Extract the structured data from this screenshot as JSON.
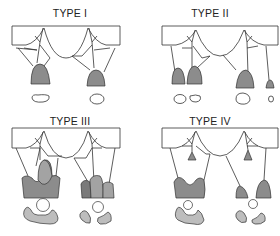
{
  "figure": {
    "panels": [
      {
        "id": "type-1",
        "title": "TYPE I"
      },
      {
        "id": "type-2",
        "title": "TYPE II"
      },
      {
        "id": "type-3",
        "title": "TYPE III"
      },
      {
        "id": "type-4",
        "title": "TYPE IV"
      }
    ],
    "colors": {
      "stroke": "#333333",
      "fill_dark": "#8c8c8c",
      "fill_medium": "#a3a3a3",
      "fill_light": "#bdbdbd",
      "background": "#ffffff"
    }
  }
}
